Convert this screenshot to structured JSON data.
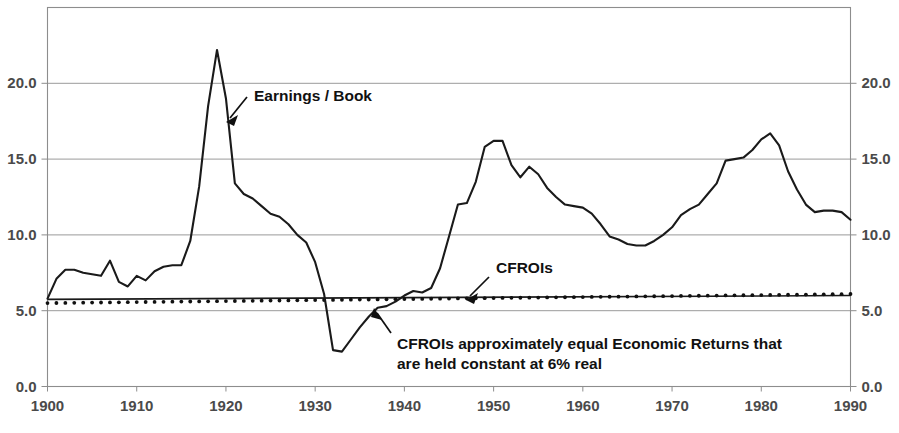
{
  "chart_data": {
    "type": "line",
    "title": "",
    "subtitle": "",
    "xlabel": "",
    "ylabel": "",
    "xlim": [
      1900,
      1990
    ],
    "ylim": [
      0.0,
      25.0
    ],
    "grid": true,
    "legend_position": "none",
    "x_tick_labels": [
      "1900",
      "1910",
      "1920",
      "1930",
      "1940",
      "1950",
      "1960",
      "1970",
      "1980",
      "1990"
    ],
    "x_ticks": [
      1900,
      1910,
      1920,
      1930,
      1940,
      1950,
      1960,
      1970,
      1980,
      1990
    ],
    "y_tick_labels_left": [
      "20.0",
      "15.0",
      "10.0",
      "5.0",
      "0.0"
    ],
    "y_tick_labels_right": [
      "20.0",
      "15.0",
      "10.0",
      "5.0",
      "0.0"
    ],
    "y_ticks": [
      20.0,
      15.0,
      10.0,
      5.0,
      0.0
    ],
    "series": [
      {
        "name": "Earnings / Book",
        "style": "solid-line",
        "x": [
          1900,
          1901,
          1902,
          1903,
          1904,
          1905,
          1906,
          1907,
          1908,
          1909,
          1910,
          1911,
          1912,
          1913,
          1914,
          1915,
          1916,
          1917,
          1918,
          1919,
          1920,
          1921,
          1922,
          1923,
          1924,
          1925,
          1926,
          1927,
          1928,
          1929,
          1930,
          1931,
          1932,
          1933,
          1934,
          1935,
          1936,
          1937,
          1938,
          1939,
          1940,
          1941,
          1942,
          1943,
          1944,
          1945,
          1946,
          1947,
          1948,
          1949,
          1950,
          1951,
          1952,
          1953,
          1954,
          1955,
          1956,
          1957,
          1958,
          1959,
          1960,
          1961,
          1962,
          1963,
          1964,
          1965,
          1966,
          1967,
          1968,
          1969,
          1970,
          1971,
          1972,
          1973,
          1974,
          1975,
          1976,
          1977,
          1978,
          1979,
          1980,
          1981,
          1982,
          1983,
          1984,
          1985,
          1986,
          1987,
          1988,
          1989,
          1990
        ],
        "values": [
          5.8,
          7.1,
          7.7,
          7.7,
          7.5,
          7.4,
          7.3,
          8.3,
          6.9,
          6.6,
          7.3,
          7.0,
          7.6,
          7.9,
          8.0,
          8.0,
          9.6,
          13.2,
          18.5,
          22.2,
          19.0,
          13.4,
          12.7,
          12.4,
          11.9,
          11.4,
          11.2,
          10.7,
          10.0,
          9.5,
          8.2,
          6.1,
          2.4,
          2.3,
          3.1,
          3.9,
          4.6,
          5.2,
          5.3,
          5.6,
          6.0,
          6.3,
          6.2,
          6.5,
          7.8,
          9.9,
          12.0,
          12.1,
          13.5,
          15.8,
          16.2,
          16.2,
          14.6,
          13.8,
          14.5,
          14.0,
          13.1,
          12.5,
          12.0,
          11.9,
          11.8,
          11.4,
          10.7,
          9.9,
          9.7,
          9.4,
          9.3,
          9.3,
          9.6,
          10.0,
          10.5,
          11.3,
          11.7,
          12.0,
          12.7,
          13.4,
          14.9,
          15.0,
          15.1,
          15.6,
          16.3,
          16.7,
          15.9,
          14.2,
          13.0,
          12.0,
          11.5,
          11.6,
          11.6,
          11.5,
          11.0
        ]
      },
      {
        "name": "CFROIs",
        "style": "dotted-line",
        "x": [
          1900,
          1990
        ],
        "values": [
          5.5,
          6.1
        ],
        "note": "approximately constant near 6% real"
      },
      {
        "name": "Economic Returns",
        "style": "thin-solid-line",
        "x": [
          1900,
          1990
        ],
        "values": [
          5.75,
          6.0
        ],
        "note": "held constant at 6% real"
      }
    ],
    "annotations": [
      {
        "id": "earnings-book",
        "label": "Earnings / Book",
        "points_to_series": "Earnings / Book"
      },
      {
        "id": "cfrois",
        "label": "CFROIs",
        "points_to_series": "CFROIs"
      },
      {
        "id": "cfrois-note",
        "label_line1": "CFROIs approximately equal Economic Returns that",
        "label_line2": "are held constant at 6% real",
        "points_to_series": "Economic Returns"
      }
    ],
    "colors": {
      "series_line": "#1a1a1a",
      "gridline": "#9a9a9a",
      "frame": "#8d8d8d",
      "tick_label": "#4a4a4a",
      "annotation_text": "#111111",
      "background": "#ffffff"
    }
  }
}
